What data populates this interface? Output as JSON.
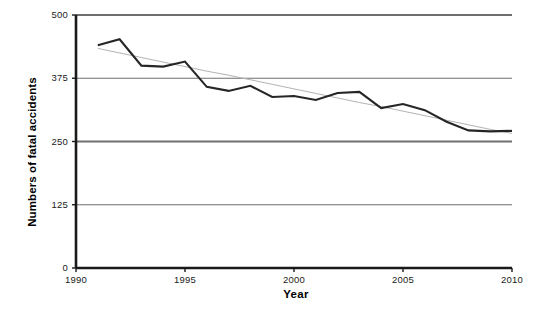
{
  "chart_data": {
    "type": "line",
    "title": "",
    "xlabel": "Year",
    "ylabel": "Numbers of fatal accidents",
    "xlim": [
      1990,
      2010
    ],
    "ylim": [
      0,
      500
    ],
    "grid": true,
    "legend": "none",
    "y_ticks": [
      0,
      125,
      250,
      375,
      500
    ],
    "y_tick_labels": [
      "0",
      "125",
      "250",
      "375",
      "500"
    ],
    "x_ticks": [
      1990,
      1995,
      2000,
      2005,
      2010
    ],
    "x_tick_labels": [
      "1990",
      "1995",
      "2000",
      "2005",
      "2010"
    ],
    "x": [
      1991,
      1992,
      1993,
      1994,
      1995,
      1996,
      1997,
      1998,
      1999,
      2000,
      2001,
      2002,
      2003,
      2004,
      2005,
      2006,
      2007,
      2008,
      2009,
      2010
    ],
    "series": [
      {
        "name": "Numbers of fatal accidents",
        "color": "#262626",
        "line_width": 2.1,
        "style": "solid",
        "values": [
          440,
          452,
          400,
          398,
          408,
          358,
          350,
          360,
          338,
          340,
          332,
          346,
          348,
          316,
          324,
          312,
          289,
          272,
          270,
          271
        ]
      },
      {
        "name": "Linear trend",
        "color": "#b3b3b3",
        "line_width": 1,
        "style": "trendline",
        "values": [
          434,
          425,
          416,
          407,
          398,
          389,
          381,
          372,
          363,
          354,
          345,
          336,
          327,
          319,
          310,
          301,
          292,
          283,
          274,
          266
        ]
      }
    ],
    "axis_color": "#1a1a1a",
    "gridline_color": "#6e6e6e"
  },
  "plot_geometry": {
    "left": 76,
    "right": 512,
    "top": 15,
    "bottom": 268
  }
}
